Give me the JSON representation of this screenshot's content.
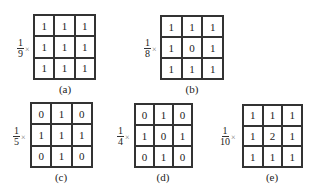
{
  "panels": [
    {
      "id": "a",
      "label": "(a)",
      "numerator": "1",
      "denominator": "9",
      "times": "×",
      "matrix": [
        [
          "1",
          "1",
          "1"
        ],
        [
          "1",
          "1",
          "1"
        ],
        [
          "1",
          "1",
          "1"
        ]
      ]
    },
    {
      "id": "b",
      "label": "(b)",
      "numerator": "1",
      "denominator": "8",
      "times": "×",
      "matrix": [
        [
          "1",
          "1",
          "1"
        ],
        [
          "1",
          "0",
          "1"
        ],
        [
          "1",
          "1",
          "1"
        ]
      ]
    },
    {
      "id": "c",
      "label": "(c)",
      "numerator": "1",
      "denominator": "5",
      "times": "×",
      "matrix": [
        [
          "0",
          "1",
          "0"
        ],
        [
          "1",
          "1",
          "1"
        ],
        [
          "0",
          "1",
          "0"
        ]
      ]
    },
    {
      "id": "d",
      "label": "(d)",
      "numerator": "1",
      "denominator": "4",
      "times": "×",
      "matrix": [
        [
          "0",
          "1",
          "0"
        ],
        [
          "1",
          "0",
          "1"
        ],
        [
          "0",
          "1",
          "0"
        ]
      ]
    },
    {
      "id": "e",
      "label": "(e)",
      "numerator": "1",
      "denominator": "10",
      "times": "×",
      "matrix": [
        [
          "1",
          "1",
          "1"
        ],
        [
          "1",
          "2",
          "1"
        ],
        [
          "1",
          "1",
          "1"
        ]
      ]
    }
  ]
}
